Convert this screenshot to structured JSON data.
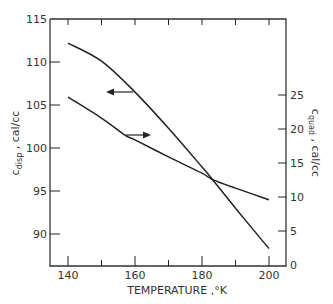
{
  "chart_data": {
    "type": "line",
    "title": "",
    "xlabel": "TEMPERATURE ,°K",
    "ylabel_left": {
      "main": "c",
      "sub": "disp",
      "rest": " ,  cal/cc"
    },
    "ylabel_right": {
      "main": "c",
      "sub": "quad",
      "rest": " ,  cal/cc"
    },
    "xlim": [
      137,
      205
    ],
    "ylim_left": [
      86.3,
      115
    ],
    "ylim_right": [
      0,
      36
    ],
    "x_ticks": [
      140,
      160,
      180,
      200
    ],
    "x_minor_ticks": [
      150,
      170,
      190
    ],
    "y_left_ticks": [
      90,
      95,
      100,
      105,
      110,
      115
    ],
    "y_right_ticks": [
      0,
      5,
      10,
      15,
      20,
      25
    ],
    "grid": false,
    "legend": "none (arrows indicate axis for each curve)",
    "series": [
      {
        "name": "c_disp",
        "axis": "left",
        "arrow": "left",
        "x": [
          140,
          150,
          160,
          170,
          180,
          183,
          190,
          200
        ],
        "values": [
          112.2,
          110.1,
          106.5,
          102.3,
          97.8,
          96.4,
          93.0,
          88.3
        ]
      },
      {
        "name": "c_quad",
        "axis": "right",
        "arrow": "right",
        "x": [
          140,
          150,
          157,
          160,
          170,
          180,
          183,
          190,
          200
        ],
        "values": [
          24.7,
          21.6,
          19.1,
          18.4,
          15.9,
          13.5,
          12.6,
          11.3,
          9.6
        ]
      }
    ],
    "annotations": [
      {
        "type": "arrow",
        "direction": "left",
        "near_series": "c_disp",
        "at_x": 160
      },
      {
        "type": "arrow",
        "direction": "right",
        "near_series": "c_quad",
        "at_x": 157
      }
    ]
  },
  "colors": {
    "line": "#222222",
    "axis": "#333333",
    "background": "#ffffff"
  }
}
